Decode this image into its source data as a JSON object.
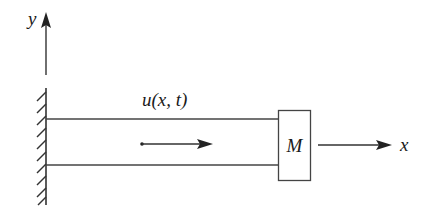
{
  "diagram": {
    "axes": {
      "y_label": "y",
      "x_label": "x"
    },
    "beam": {
      "displacement_label": "u(x, t)"
    },
    "mass": {
      "label": "M"
    },
    "icons": {
      "wall": "fixed-wall-hatch-icon",
      "y_axis": "arrow-up-icon",
      "x_axis": "arrow-right-icon",
      "displacement": "arrow-right-icon"
    },
    "colors": {
      "stroke": "#333333",
      "background": "#ffffff"
    }
  }
}
